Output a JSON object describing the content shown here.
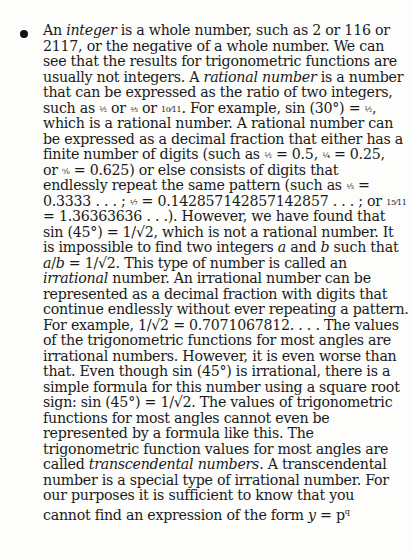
{
  "document": {
    "bullet": "•",
    "lines": [
      "An integer is a whole number, such as 2 or 116 or",
      "2117, or the negative of a whole number. We can",
      "see that the results for trigonometric functions are",
      "usually not integers. A rational number is a number",
      "that can be expressed as the ratio of two integers,",
      "such as ½ or ⅔ or 10/11. For example, sin (30°) = ½,",
      "which is a rational number. A rational number can",
      "be expressed as a decimal fraction that either has a",
      "finite number of digits (such as ½ = 0.5, ¼ = 0.25,",
      "or ⅝ = 0.625) or else consists of digits that",
      "endlessly repeat the same pattern (such as ⅓ =",
      "0.3333 . . . ; ⅐ = 0.142857142857142857 . . . ; or 15/11",
      "= 1.36363636 . . .). However, we have found that",
      "sin (45°) = 1/√2, which is not a rational number. It",
      "is impossible to find two integers a and b such that",
      "a/b = 1/√2. This type of number is called an",
      "irrational number. An irrational number can be",
      "represented as a decimal fraction with digits that",
      "continue endlessly without ever repeating a pattern.",
      "For example, 1/√2 = 0.7071067812. . . . The values",
      "of the trigonometric functions for most angles are",
      "irrational numbers. However, it is even worse than",
      "that. Even though sin (45°) is irrational, there is a",
      "simple formula for this number using a square root",
      "sign: sin (45°) = 1/√2. The values of trigonometric",
      "functions for most angles cannot even be",
      "represented by a formula like this. The",
      "trigonometric function values for most angles are",
      "called transcendental numbers. A transcendental",
      "number is a special type of irrational number. For",
      "our purposes it is sufficient to know that you",
      "cannot find an expression of the form y = p^q"
    ],
    "segments": {
      "l1a": "An ",
      "l1i": "integer",
      "l1b": " is a whole number, such as 2 or 116 or",
      "l2": "2117, or the negative of a whole number. We can",
      "l3": "see that the results for trigonometric functions are",
      "l4a": "usually not integers. A ",
      "l4i": "rational number",
      "l4b": " is a number",
      "l5": "that can be expressed as the ratio of two integers,",
      "l6a": "such as ",
      "l6f1": "½",
      "l6b": " or ",
      "l6f2": "⅔",
      "l6c": " or ",
      "l6f3": "10⁄11",
      "l6d": ". For example, sin (30°) = ",
      "l6f4": "½",
      "l6e": ",",
      "l7": "which is a rational number. A rational number can",
      "l8": "be expressed as a decimal fraction that either has a",
      "l9a": "finite number of digits (such as ",
      "l9f1": "½",
      "l9b": " = 0.5, ",
      "l9f2": "¼",
      "l9c": " = 0.25,",
      "l10a": "or ",
      "l10f": "⅝",
      "l10b": " = 0.625) or else consists of digits that",
      "l11a": "endlessly repeat the same pattern (such as ",
      "l11f": "⅓",
      "l11b": " =",
      "l12a": "0.3333 . . . ; ",
      "l12f1": "⅐",
      "l12b": " = 0.142857142857142857 . . . ; or ",
      "l12f2": "15⁄11",
      "l13": "= 1.36363636 . . .). However, we have found that",
      "l14": "sin (45°) = 1/√2, which is not a rational number. It",
      "l15a": "is impossible to find two integers ",
      "l15i1": "a",
      "l15b": " and ",
      "l15i2": "b",
      "l15c": " such that",
      "l16a": "a",
      "l16b": "/",
      "l16c": "b",
      "l16d": " = 1/√2. This type of number is called an",
      "l17i": "irrational",
      "l17b": " number. An irrational number can be",
      "l18": "represented as a decimal fraction with digits that",
      "l19": "continue endlessly without ever repeating a pattern.",
      "l20": "For example, 1/√2 = 0.7071067812. . . . The values",
      "l21": "of the trigonometric functions for most angles are",
      "l22": "irrational numbers. However, it is even worse than",
      "l23": "that. Even though sin (45°) is irrational, there is a",
      "l24": "simple formula for this number using a square root",
      "l25": "sign: sin (45°) = 1/√2. The values of trigonometric",
      "l26": "functions for most angles cannot even be",
      "l27": "represented by a formula like this. The",
      "l28": "trigonometric function values for most angles are",
      "l29a": "called ",
      "l29i": "transcendental numbers",
      "l29b": ". A transcendental",
      "l30": "number is a special type of irrational number. For",
      "l31": "our purposes it is sufficient to know that you",
      "l32a": "cannot find an expression of the form ",
      "l32i": "y",
      "l32b": " = p",
      "l32sup": "q"
    }
  }
}
